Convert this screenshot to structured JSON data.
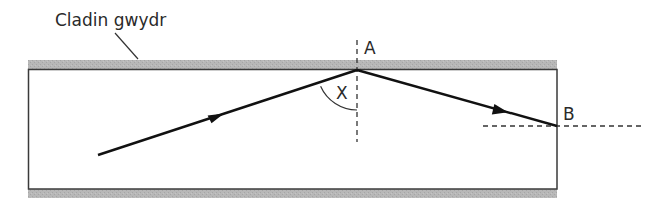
{
  "diagram": {
    "type": "optical-fibre-total-internal-reflection",
    "labels": {
      "cladding": "Cladin gwydr",
      "point_a": "A",
      "point_b": "B",
      "angle": "X"
    },
    "colors": {
      "cladding_fill": "#b4b4b4",
      "line": "#111111",
      "core_border": "#3a3a3a",
      "dashed": "#333333",
      "text": "#2a2a2a",
      "background": "#ffffff"
    },
    "geometry": {
      "core": {
        "x": 28,
        "y": 69,
        "width": 529,
        "height": 120
      },
      "cladding_top": {
        "x": 28,
        "y": 60,
        "width": 529,
        "height": 9
      },
      "cladding_bottom": {
        "x": 28,
        "y": 189,
        "width": 529,
        "height": 9
      },
      "point_a": {
        "x": 357,
        "y": 70
      },
      "point_b": {
        "x": 557,
        "y": 126
      },
      "ray_start": {
        "x": 98,
        "y": 155
      },
      "normal_a": {
        "x": 357,
        "y1": 40,
        "y2": 142
      },
      "normal_b": {
        "y": 126,
        "x1": 483,
        "x2": 645
      }
    }
  }
}
